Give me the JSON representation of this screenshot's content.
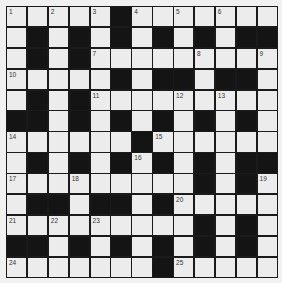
{
  "puzzle": {
    "size": 13,
    "colors": {
      "white_cell": "#ececec",
      "black_cell": "#141414",
      "grid_line": "#1a1a1a",
      "background": "#f1f1f1",
      "number": "#333333"
    },
    "rows": [
      ".....B.......",
      ".B.B.B.B.B.BB",
      ".B.B.........",
      ".....B.BB.BB.",
      ".B.B.........",
      "BB.B.B.B.B.B.",
      "......B......",
      ".B.B.B.B.B.BB",
      ".........B.B.",
      ".BB.BB.B.....",
      ".........B.B.",
      "BB.B.B.B.B.B.",
      ".......B....."
    ],
    "numbers": [
      {
        "r": 0,
        "c": 0,
        "n": "1"
      },
      {
        "r": 0,
        "c": 2,
        "n": "2"
      },
      {
        "r": 0,
        "c": 4,
        "n": "3"
      },
      {
        "r": 0,
        "c": 6,
        "n": "4"
      },
      {
        "r": 0,
        "c": 8,
        "n": "5"
      },
      {
        "r": 0,
        "c": 10,
        "n": "6"
      },
      {
        "r": 2,
        "c": 4,
        "n": "7"
      },
      {
        "r": 2,
        "c": 9,
        "n": "8"
      },
      {
        "r": 2,
        "c": 12,
        "n": "9"
      },
      {
        "r": 3,
        "c": 0,
        "n": "10"
      },
      {
        "r": 4,
        "c": 4,
        "n": "11"
      },
      {
        "r": 4,
        "c": 8,
        "n": "12"
      },
      {
        "r": 4,
        "c": 10,
        "n": "13"
      },
      {
        "r": 6,
        "c": 0,
        "n": "14"
      },
      {
        "r": 6,
        "c": 7,
        "n": "15"
      },
      {
        "r": 7,
        "c": 6,
        "n": "16"
      },
      {
        "r": 8,
        "c": 0,
        "n": "17"
      },
      {
        "r": 8,
        "c": 3,
        "n": "18"
      },
      {
        "r": 8,
        "c": 12,
        "n": "19"
      },
      {
        "r": 9,
        "c": 8,
        "n": "20"
      },
      {
        "r": 10,
        "c": 0,
        "n": "21"
      },
      {
        "r": 10,
        "c": 2,
        "n": "22"
      },
      {
        "r": 10,
        "c": 4,
        "n": "23"
      },
      {
        "r": 12,
        "c": 0,
        "n": "24"
      },
      {
        "r": 12,
        "c": 8,
        "n": "25"
      }
    ]
  }
}
